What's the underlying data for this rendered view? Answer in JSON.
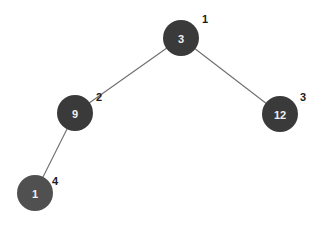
{
  "diagram": {
    "type": "binary-tree",
    "node_radius": 18,
    "edge_color": "#6e6e6e",
    "nodes": [
      {
        "id": "n1",
        "value": "3",
        "index": "1",
        "cx": 181,
        "cy": 38,
        "fill": "#3a3a3a",
        "label_x": 205,
        "label_y": 19
      },
      {
        "id": "n2",
        "value": "9",
        "index": "2",
        "cx": 75,
        "cy": 113,
        "fill": "#3a3a3a",
        "label_x": 99,
        "label_y": 97
      },
      {
        "id": "n3",
        "value": "12",
        "index": "3",
        "cx": 280,
        "cy": 114,
        "fill": "#3a3a3a",
        "label_x": 303,
        "label_y": 97
      },
      {
        "id": "n4",
        "value": "1",
        "index": "4",
        "cx": 35,
        "cy": 193,
        "fill": "#505050",
        "label_x": 55,
        "label_y": 181
      }
    ],
    "edges": [
      {
        "from": "n1",
        "to": "n2"
      },
      {
        "from": "n1",
        "to": "n3"
      },
      {
        "from": "n2",
        "to": "n4"
      }
    ]
  }
}
